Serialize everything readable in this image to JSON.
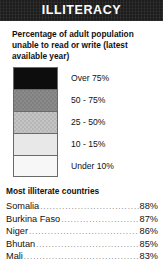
{
  "header": {
    "title": "ILLITERACY"
  },
  "description": "Percentage of adult population unable to read or write (latest available year)",
  "legend": {
    "items": [
      {
        "label": "Over 75%",
        "color": "#0d0d0d",
        "dither": false
      },
      {
        "label": "50 - 75%",
        "color": "#8a8a8a",
        "dither": true
      },
      {
        "label": "25 - 50%",
        "color": "#c4c4c4",
        "dither": true
      },
      {
        "label": "10 - 15%",
        "color": "#e8e8e8",
        "dither": false
      },
      {
        "label": "Under 10%",
        "color": "#f7f7f7",
        "dither": false
      }
    ]
  },
  "ranking": {
    "heading": "Most illiterate countries",
    "items": [
      {
        "country": "Somalia",
        "value": "88%"
      },
      {
        "country": "Burkina Faso",
        "value": "87%"
      },
      {
        "country": "Niger",
        "value": "86%"
      },
      {
        "country": "Bhutan",
        "value": "85%"
      },
      {
        "country": "Mali",
        "value": "83%"
      }
    ]
  },
  "chart_data": {
    "type": "table",
    "title": "ILLITERACY",
    "subtitle": "Percentage of adult population unable to read or write (latest available year)",
    "legend_position": "left",
    "categories": [
      "Somalia",
      "Burkina Faso",
      "Niger",
      "Bhutan",
      "Mali"
    ],
    "values": [
      88,
      87,
      86,
      85,
      83
    ],
    "xlabel": "",
    "ylabel": "Illiteracy rate (%)",
    "ylim": [
      0,
      100
    ],
    "grid": false,
    "legend_entries": [
      {
        "label": "Over 75%",
        "range": [
          75,
          100
        ],
        "color": "#0d0d0d"
      },
      {
        "label": "50 - 75%",
        "range": [
          50,
          75
        ],
        "color": "#8a8a8a"
      },
      {
        "label": "25 - 50%",
        "range": [
          25,
          50
        ],
        "color": "#c4c4c4"
      },
      {
        "label": "10 - 15%",
        "range": [
          10,
          15
        ],
        "color": "#e8e8e8"
      },
      {
        "label": "Under 10%",
        "range": [
          0,
          10
        ],
        "color": "#f7f7f7"
      }
    ]
  }
}
